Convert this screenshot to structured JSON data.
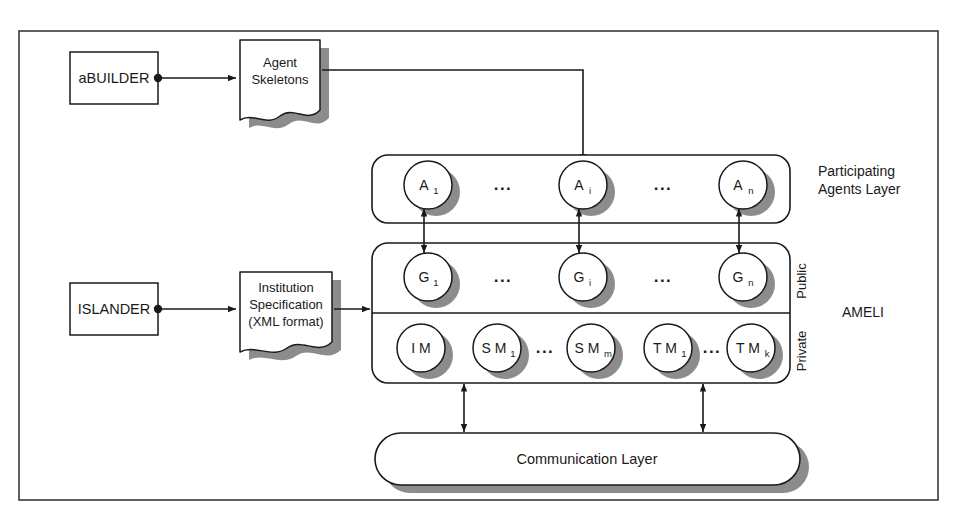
{
  "figure": {
    "frame": {
      "label": "diagram-frame"
    }
  },
  "colors": {
    "stroke": "#1a1a1a",
    "shadow": "#8c8c8c",
    "fill": "#ffffff",
    "background": "#ffffff"
  },
  "tools": [
    {
      "id": "abuilder",
      "label": "aBUILDER",
      "x": 70,
      "y": 52,
      "w": 88,
      "h": 52
    },
    {
      "id": "islander",
      "label": "ISLANDER",
      "x": 70,
      "y": 283,
      "w": 88,
      "h": 52
    }
  ],
  "documents": [
    {
      "id": "agent-skeletons",
      "lines": [
        "Agent",
        "Skeletons"
      ],
      "x": 240,
      "y": 40,
      "w": 80,
      "h": 76
    },
    {
      "id": "institution-specification",
      "lines": [
        "Institution",
        "Specification",
        "(XML format)"
      ],
      "x": 240,
      "y": 272,
      "w": 92,
      "h": 76
    }
  ],
  "layers": [
    {
      "id": "participating-agents-layer",
      "side_label": [
        "Participating",
        "Agents Layer"
      ],
      "x": 372,
      "y": 155,
      "w": 418,
      "h": 68
    },
    {
      "id": "ameli-layer",
      "side_label": [
        "AMELI"
      ],
      "x": 372,
      "y": 243,
      "w": 418,
      "h": 140,
      "divider_y": 313,
      "sublabels": [
        "Public",
        "Private"
      ]
    },
    {
      "id": "communication-layer",
      "label": "Communication Layer",
      "x": 375,
      "y": 433,
      "w": 425,
      "h": 52
    }
  ],
  "nodes": {
    "agents": [
      {
        "id": "agent-1",
        "base": "A",
        "sub": "1",
        "cx": 428,
        "cy": 185
      },
      {
        "id": "agent-i",
        "base": "A",
        "sub": "i",
        "cx": 583,
        "cy": 185
      },
      {
        "id": "agent-n",
        "base": "A",
        "sub": "n",
        "cx": 743,
        "cy": 185
      }
    ],
    "governors": [
      {
        "id": "governor-1",
        "base": "G",
        "sub": "1",
        "cx": 428,
        "cy": 277
      },
      {
        "id": "governor-i",
        "base": "G",
        "sub": "i",
        "cx": 583,
        "cy": 277
      },
      {
        "id": "governor-n",
        "base": "G",
        "sub": "n",
        "cx": 743,
        "cy": 277
      }
    ],
    "managers": [
      {
        "id": "institution-manager",
        "base": "I M",
        "sub": "",
        "cx": 421,
        "cy": 348
      },
      {
        "id": "scene-manager-1",
        "base": "S M",
        "sub": "1",
        "cx": 497,
        "cy": 348
      },
      {
        "id": "scene-manager-m",
        "base": "S M",
        "sub": "m",
        "cx": 591,
        "cy": 348
      },
      {
        "id": "transition-manager-1",
        "base": "T M",
        "sub": "1",
        "cx": 668,
        "cy": 348
      },
      {
        "id": "transition-manager-k",
        "base": "T M",
        "sub": "k",
        "cx": 751,
        "cy": 348
      }
    ]
  },
  "ellipses": [
    {
      "id": "agents-ellipsis-left",
      "text": "...",
      "x": 503,
      "y": 190
    },
    {
      "id": "agents-ellipsis-right",
      "text": "...",
      "x": 663,
      "y": 190
    },
    {
      "id": "governors-ellipsis-left",
      "text": "...",
      "x": 503,
      "y": 282
    },
    {
      "id": "governors-ellipsis-right",
      "text": "...",
      "x": 663,
      "y": 282
    },
    {
      "id": "managers-ellipsis-scene",
      "text": "...",
      "x": 545,
      "y": 352
    },
    {
      "id": "managers-ellipsis-transition",
      "text": "...",
      "x": 712,
      "y": 352
    }
  ],
  "connectors": [
    {
      "id": "abuilder-to-skeletons",
      "kind": "arrow-right"
    },
    {
      "id": "skeletons-to-agent-i",
      "kind": "elbow-arrow-down"
    },
    {
      "id": "islander-to-ameli",
      "kind": "arrow-right"
    },
    {
      "id": "agent-governor-link-1",
      "kind": "double-arrow-vertical"
    },
    {
      "id": "agent-governor-link-i",
      "kind": "double-arrow-vertical"
    },
    {
      "id": "agent-governor-link-n",
      "kind": "double-arrow-vertical"
    },
    {
      "id": "ameli-to-communication-left",
      "kind": "double-arrow-vertical"
    },
    {
      "id": "ameli-to-communication-right",
      "kind": "double-arrow-vertical"
    }
  ]
}
